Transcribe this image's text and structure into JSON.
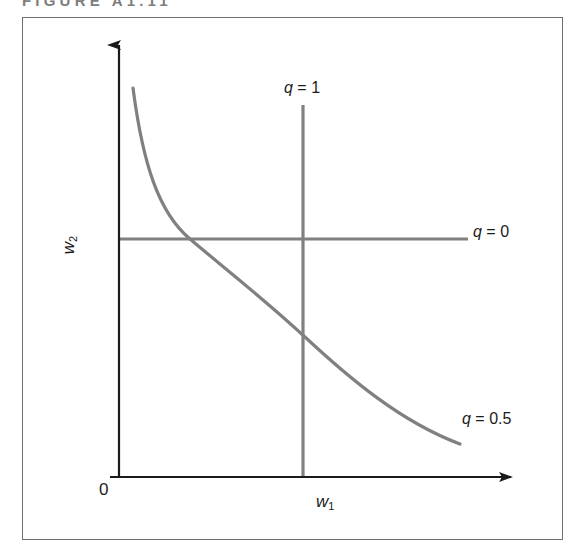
{
  "figure": {
    "number": "FIGURE A1.11",
    "axes": {
      "x_label": "w",
      "x_label_sub": "1",
      "y_label": "w",
      "y_label_sub": "2",
      "origin_label": "0"
    },
    "annotations": {
      "q_equals_1": "q = 1",
      "q_equals_0": "q = 0",
      "q_equals_0_5": "q = 0.5"
    },
    "colors": {
      "frame": "#6f6f6f",
      "axis": "#1b1b1b",
      "curve": "#808080",
      "line": "#808080",
      "label": "#1b1b1b",
      "caption": "#7d7d7d",
      "background": "#ffffff"
    }
  },
  "chart_data": {
    "type": "line",
    "title": "FIGURE A1.11",
    "xlabel": "w1",
    "ylabel": "w2",
    "grid": false,
    "legend": "inline-annotations",
    "xlim": [
      0,
      1
    ],
    "ylim": [
      0,
      1
    ],
    "annotations": [
      {
        "text": "q = 1",
        "x": 0.47,
        "y": 0.9
      },
      {
        "text": "q = 0",
        "x": 0.93,
        "y": 0.56
      },
      {
        "text": "q = 0.5",
        "x": 0.9,
        "y": 0.16
      }
    ],
    "series": [
      {
        "name": "q = 0.5",
        "kind": "isoquant-curve",
        "description": "Convex hyperbolic isoquant for CES production with q = 0.5, asymptotic to both axes",
        "color": "#808080",
        "x": [
          0.05,
          0.08,
          0.12,
          0.17,
          0.23,
          0.3,
          0.38,
          0.47,
          0.57,
          0.68,
          0.8,
          0.88
        ],
        "y": [
          0.89,
          0.73,
          0.58,
          0.46,
          0.37,
          0.3,
          0.24,
          0.2,
          0.16,
          0.13,
          0.11,
          0.1
        ]
      },
      {
        "name": "q = 1",
        "kind": "vertical-line",
        "description": "Vertical isoquant at fixed w1 for q = 1 (Leontief / fixed proportion limit)",
        "color": "#808080",
        "x": [
          0.47,
          0.47
        ],
        "y": [
          0.86,
          0.0
        ]
      },
      {
        "name": "q = 0",
        "kind": "horizontal-line",
        "description": "Horizontal isoquant at fixed w2 for q = 0 (Cobb-Douglas limit reference)",
        "color": "#808080",
        "x": [
          0.0,
          0.89
        ],
        "y": [
          0.54,
          0.54
        ]
      }
    ]
  }
}
